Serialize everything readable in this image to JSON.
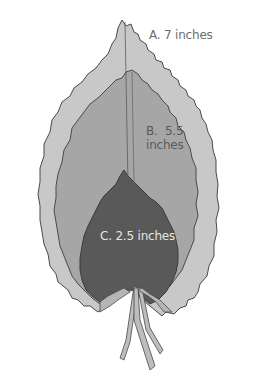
{
  "figure": {
    "leaves": [
      {
        "id": "A",
        "label": "A.  7 inches",
        "letter": "A.",
        "size": "7 inches",
        "fill": "#c8c8c8"
      },
      {
        "id": "B",
        "label": "B.  5.5 inches",
        "letter": "B.",
        "size_line1": "5.5",
        "size_line2": "inches",
        "fill": "#a6a6a6"
      },
      {
        "id": "C",
        "label": "C.  2.5 inches",
        "letter": "C.",
        "size": "2.5 inches",
        "fill": "#595959"
      }
    ],
    "colors": {
      "background": "#ffffff",
      "outline": "#4a4a4a",
      "stem": "#bdbdbd"
    }
  }
}
